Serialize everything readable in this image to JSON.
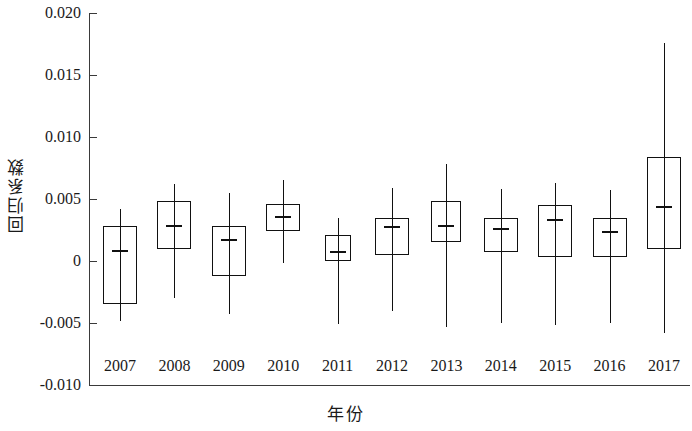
{
  "chart_data": {
    "type": "box",
    "title": "",
    "xlabel": "年份",
    "ylabel": "回归系数",
    "ylim": [
      -0.01,
      0.02
    ],
    "grid": false,
    "legend": null,
    "ytick_labels": [
      "0.020",
      "0.015",
      "0.010",
      "0.005",
      "0",
      "-0.005",
      "-0.010"
    ],
    "ytick_values": [
      0.02,
      0.015,
      0.01,
      0.005,
      0,
      -0.005,
      -0.01
    ],
    "categories": [
      "2007",
      "2008",
      "2009",
      "2010",
      "2011",
      "2012",
      "2013",
      "2014",
      "2015",
      "2016",
      "2017"
    ],
    "boxes": [
      {
        "category": "2007",
        "whisker_low": -0.0048,
        "q1": -0.0035,
        "median": 0.0009,
        "q3": 0.0028,
        "whisker_high": 0.0042
      },
      {
        "category": "2008",
        "whisker_low": -0.003,
        "q1": 0.001,
        "median": 0.0029,
        "q3": 0.0048,
        "whisker_high": 0.0062
      },
      {
        "category": "2009",
        "whisker_low": -0.0043,
        "q1": -0.0012,
        "median": 0.0018,
        "q3": 0.0028,
        "whisker_high": 0.0055
      },
      {
        "category": "2010",
        "whisker_low": -0.0002,
        "q1": 0.0024,
        "median": 0.0036,
        "q3": 0.0046,
        "whisker_high": 0.0065
      },
      {
        "category": "2011",
        "whisker_low": -0.0051,
        "q1": 0.0,
        "median": 0.0008,
        "q3": 0.0021,
        "whisker_high": 0.0035
      },
      {
        "category": "2012",
        "whisker_low": -0.004,
        "q1": 0.0005,
        "median": 0.0028,
        "q3": 0.0035,
        "whisker_high": 0.0059
      },
      {
        "category": "2013",
        "whisker_low": -0.0053,
        "q1": 0.0015,
        "median": 0.0029,
        "q3": 0.0048,
        "whisker_high": 0.0078
      },
      {
        "category": "2014",
        "whisker_low": -0.005,
        "q1": 0.0007,
        "median": 0.0027,
        "q3": 0.0035,
        "whisker_high": 0.0058
      },
      {
        "category": "2015",
        "whisker_low": -0.0052,
        "q1": 0.0003,
        "median": 0.0034,
        "q3": 0.0045,
        "whisker_high": 0.0063
      },
      {
        "category": "2016",
        "whisker_low": -0.005,
        "q1": 0.0003,
        "median": 0.0024,
        "q3": 0.0035,
        "whisker_high": 0.0057
      },
      {
        "category": "2017",
        "whisker_low": -0.0058,
        "q1": 0.001,
        "median": 0.0044,
        "q3": 0.0084,
        "whisker_high": 0.0176
      }
    ],
    "box_widths": [
      34,
      34,
      34,
      34,
      26,
      34,
      30,
      34,
      34,
      34,
      34
    ],
    "colors": {
      "axis": "#3a3a3a",
      "box_stroke": "#111111",
      "median": "#111111",
      "background": "#ffffff"
    }
  },
  "axis": {
    "y_title": "回归系数",
    "x_title": "年份"
  }
}
